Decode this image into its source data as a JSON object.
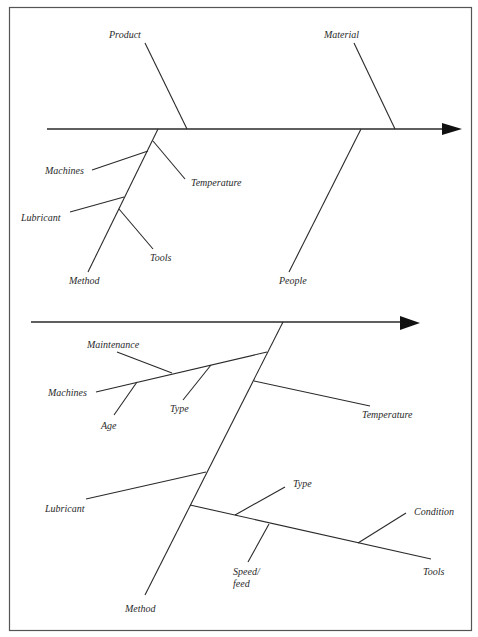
{
  "diagrams": [
    {
      "id": "top",
      "type": "fishbone",
      "main_categories": [
        "Product",
        "Material",
        "Method",
        "People"
      ],
      "labels": {
        "product": "Product",
        "material": "Material",
        "machines": "Machines",
        "temperature": "Temperature",
        "lubricant": "Lubricant",
        "tools": "Tools",
        "method": "Method",
        "people": "People"
      },
      "structure": {
        "above_spine": [
          "Product",
          "Material"
        ],
        "below_spine": {
          "Method": [
            "Machines",
            "Temperature",
            "Lubricant",
            "Tools"
          ],
          "People": []
        }
      }
    },
    {
      "id": "bottom",
      "type": "fishbone",
      "main_categories": [
        "Method"
      ],
      "labels": {
        "maintenance": "Maintenance",
        "machines": "Machines",
        "type1": "Type",
        "age": "Age",
        "temperature": "Temperature",
        "lubricant": "Lubricant",
        "type2": "Type",
        "condition": "Condition",
        "speed": "Speed/",
        "feed": "feed",
        "tools": "Tools",
        "method": "Method"
      },
      "structure": {
        "Method": {
          "Machines": [
            "Maintenance",
            "Type",
            "Age"
          ],
          "Temperature": [],
          "Lubricant": [],
          "Tools": [
            "Type",
            "Condition",
            "Speed/feed"
          ]
        }
      }
    }
  ]
}
